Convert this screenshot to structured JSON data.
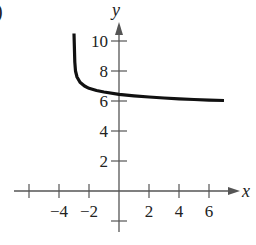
{
  "panel": {
    "label": ")"
  },
  "chart_data": {
    "type": "line",
    "title": "",
    "xlabel": "x",
    "ylabel": "y",
    "xlim": [
      -7,
      8
    ],
    "ylim": [
      -2,
      12
    ],
    "grid": false,
    "x_ticks": [
      -6,
      -4,
      -2,
      2,
      4,
      6
    ],
    "x_tick_labels": [
      "-4",
      "-2",
      "2",
      "4",
      "6"
    ],
    "x_tick_labels_at": [
      -4,
      -2,
      2,
      4,
      6
    ],
    "y_ticks": [
      -2,
      2,
      4,
      6,
      8,
      10
    ],
    "y_tick_labels": [
      "2",
      "4",
      "6",
      "8",
      "10"
    ],
    "y_tick_labels_at": [
      2,
      4,
      6,
      8,
      10
    ],
    "series": [
      {
        "name": "curve",
        "x": [
          -3.0,
          -2.95,
          -2.9,
          -2.8,
          -2.6,
          -2.3,
          -2.0,
          -1.5,
          -1.0,
          0.0,
          1.0,
          2.0,
          3.0,
          4.0,
          5.0,
          6.0,
          7.0
        ],
        "y": [
          10.5,
          8.6,
          8.0,
          7.6,
          7.25,
          7.0,
          6.85,
          6.7,
          6.6,
          6.45,
          6.35,
          6.27,
          6.2,
          6.15,
          6.1,
          6.06,
          6.03
        ]
      }
    ],
    "vertical_asymptote": -3,
    "horizontal_asymptote": 6,
    "colors": {
      "curve": "#111111",
      "axes": "#555555"
    }
  }
}
